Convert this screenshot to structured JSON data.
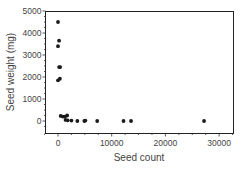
{
  "chart_data": {
    "type": "scatter",
    "title": "",
    "xlabel": "Seed count",
    "ylabel": "Seed weight (mg)",
    "xlim": [
      -3000,
      32500
    ],
    "ylim": [
      -500,
      5000
    ],
    "xticks": [
      0,
      10000,
      20000,
      30000
    ],
    "xtick_labels": [
      "0",
      "10000",
      "20000",
      "30000"
    ],
    "yticks": [
      0,
      1000,
      2000,
      3000,
      4000,
      5000
    ],
    "ytick_labels": [
      "0",
      "1000",
      "2000",
      "3000",
      "4000",
      "5000"
    ],
    "grid": false,
    "legend": null,
    "series": [
      {
        "name": "seeds",
        "color": "#1a1a1a",
        "points": [
          {
            "x": 0,
            "y": 4500
          },
          {
            "x": 200,
            "y": 3650
          },
          {
            "x": 0,
            "y": 3400
          },
          {
            "x": 200,
            "y": 2450
          },
          {
            "x": 400,
            "y": 2450
          },
          {
            "x": 0,
            "y": 1850
          },
          {
            "x": 350,
            "y": 1920
          },
          {
            "x": 500,
            "y": 230
          },
          {
            "x": 900,
            "y": 200
          },
          {
            "x": 1300,
            "y": 200
          },
          {
            "x": 1700,
            "y": 250
          },
          {
            "x": 1400,
            "y": 50
          },
          {
            "x": 1800,
            "y": 30
          },
          {
            "x": 2500,
            "y": 20
          },
          {
            "x": 3600,
            "y": 0
          },
          {
            "x": 4900,
            "y": 0
          },
          {
            "x": 5100,
            "y": 20
          },
          {
            "x": 7300,
            "y": 0
          },
          {
            "x": 12200,
            "y": 0
          },
          {
            "x": 13600,
            "y": 0
          },
          {
            "x": 27200,
            "y": 0
          }
        ]
      }
    ]
  }
}
